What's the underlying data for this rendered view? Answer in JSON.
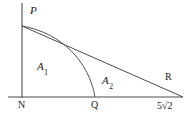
{
  "figure": {
    "kind": "geometry-diagram",
    "background_color": "#ffffff",
    "stroke_color": "#4d4d4d",
    "text_color": "#1a1a1a",
    "labels": {
      "p": "P",
      "n": "N",
      "q": "Q",
      "r": "R",
      "area_1_base": "A",
      "area_1_sub": "1",
      "area_2_base": "A",
      "area_2_sub": "2",
      "axis_length": "5√2"
    },
    "points": {
      "P": {
        "x": 22,
        "y": 26
      },
      "N": {
        "x": 22,
        "y": 97
      },
      "Q": {
        "x": 95,
        "y": 97
      },
      "R": {
        "x": 162,
        "y": 86
      },
      "axis_right_end": {
        "x": 183,
        "y": 97
      },
      "vertical_axis_top": {
        "x": 22,
        "y": 3
      },
      "axis_left_end": {
        "x": 8,
        "y": 97
      }
    },
    "curve": {
      "name": "arc-P-to-Q",
      "from": {
        "x": 22,
        "y": 26
      },
      "control_1": {
        "x": 62,
        "y": 33
      },
      "control_2": {
        "x": 89,
        "y": 62
      },
      "to": {
        "x": 95,
        "y": 97
      }
    },
    "segment": {
      "name": "line-P-to-axis",
      "from": {
        "x": 22,
        "y": 26
      },
      "to": {
        "x": 183,
        "y": 97
      }
    }
  }
}
